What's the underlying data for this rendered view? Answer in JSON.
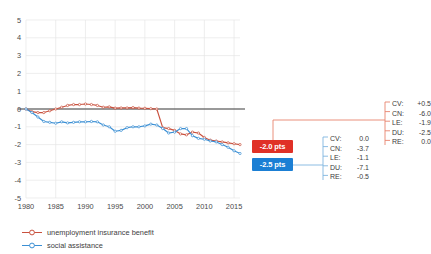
{
  "chart_data": {
    "type": "line",
    "title": "",
    "xlabel": "",
    "ylabel": "",
    "xlim": [
      1980,
      2016
    ],
    "ylim": [
      -5,
      5
    ],
    "grid": true,
    "zero_line": true,
    "xticks": [
      "1980",
      "1985",
      "1990",
      "1995",
      "2000",
      "2005",
      "2010",
      "2015"
    ],
    "yticks": [
      "5",
      "4",
      "3",
      "2",
      "1",
      "0",
      "-1",
      "-2",
      "-3",
      "-4",
      "-5"
    ],
    "legend_position": "bottom-left",
    "series": [
      {
        "name": "unemployment insurance benefit",
        "color": "#c9513e",
        "x": [
          1980,
          1981,
          1982,
          1983,
          1984,
          1985,
          1986,
          1987,
          1988,
          1989,
          1990,
          1991,
          1992,
          1993,
          1994,
          1995,
          1996,
          1997,
          1998,
          1999,
          2000,
          2001,
          2002,
          2003,
          2004,
          2005,
          2006,
          2007,
          2008,
          2009,
          2010,
          2011,
          2012,
          2013,
          2014,
          2015,
          2016
        ],
        "values": [
          0.0,
          -0.15,
          -0.2,
          -0.2,
          -0.1,
          0.0,
          0.1,
          0.2,
          0.25,
          0.25,
          0.28,
          0.25,
          0.2,
          0.1,
          0.12,
          0.05,
          0.06,
          0.06,
          0.08,
          0.05,
          0.04,
          0.02,
          0.0,
          -1.05,
          -1.1,
          -1.2,
          -1.4,
          -1.45,
          -1.3,
          -1.35,
          -1.6,
          -1.75,
          -1.8,
          -1.85,
          -1.9,
          -1.95,
          -2.0
        ]
      },
      {
        "name": "social assistance",
        "color": "#3b8fd4",
        "x": [
          1980,
          1981,
          1982,
          1983,
          1984,
          1985,
          1986,
          1987,
          1988,
          1989,
          1990,
          1991,
          1992,
          1993,
          1994,
          1995,
          1996,
          1997,
          1998,
          1999,
          2000,
          2001,
          2002,
          2003,
          2004,
          2005,
          2006,
          2007,
          2008,
          2009,
          2010,
          2011,
          2012,
          2013,
          2014,
          2015,
          2016
        ],
        "values": [
          0.0,
          -0.2,
          -0.45,
          -0.7,
          -0.75,
          -0.8,
          -0.72,
          -0.78,
          -0.75,
          -0.72,
          -0.72,
          -0.7,
          -0.72,
          -0.9,
          -1.0,
          -1.25,
          -1.2,
          -1.05,
          -1.0,
          -1.0,
          -0.95,
          -0.85,
          -0.9,
          -1.1,
          -1.35,
          -1.3,
          -1.1,
          -1.1,
          -1.5,
          -1.65,
          -1.7,
          -1.8,
          -1.85,
          -2.0,
          -2.15,
          -2.35,
          -2.5
        ]
      }
    ]
  },
  "badges": {
    "red": "-2.0 pts",
    "blue": "-2.5 pts"
  },
  "annotation_lists": {
    "blue": {
      "color": "#3b8fd4",
      "rows": [
        {
          "key": "CV:",
          "value": "0.0"
        },
        {
          "key": "CN:",
          "value": "-3.7"
        },
        {
          "key": "LE:",
          "value": "-1.1"
        },
        {
          "key": "DU:",
          "value": "-7.1"
        },
        {
          "key": "RE:",
          "value": "-0.5"
        }
      ]
    },
    "red": {
      "color": "#e8836e",
      "rows": [
        {
          "key": "CV:",
          "value": "+0.5"
        },
        {
          "key": "CN:",
          "value": "-6.0"
        },
        {
          "key": "LE:",
          "value": "-1.9"
        },
        {
          "key": "DU:",
          "value": "-2.5"
        },
        {
          "key": "RE:",
          "value": "0.0"
        }
      ]
    }
  },
  "legend": {
    "items": [
      {
        "label": "unemployment insurance benefit",
        "color": "#c9513e"
      },
      {
        "label": "social assistance",
        "color": "#3b8fd4"
      }
    ]
  },
  "colors": {
    "grid": "#e6e6e6",
    "axis_text": "#4a4a4a",
    "zero_line": "#3c3c3c",
    "red_badge": "#e03127",
    "blue_badge": "#1b7fd4",
    "red_line": "#c9513e",
    "blue_line": "#3b8fd4",
    "connector_red": "#e8836e",
    "connector_blue": "#7fb6e0",
    "background": "#ffffff"
  }
}
